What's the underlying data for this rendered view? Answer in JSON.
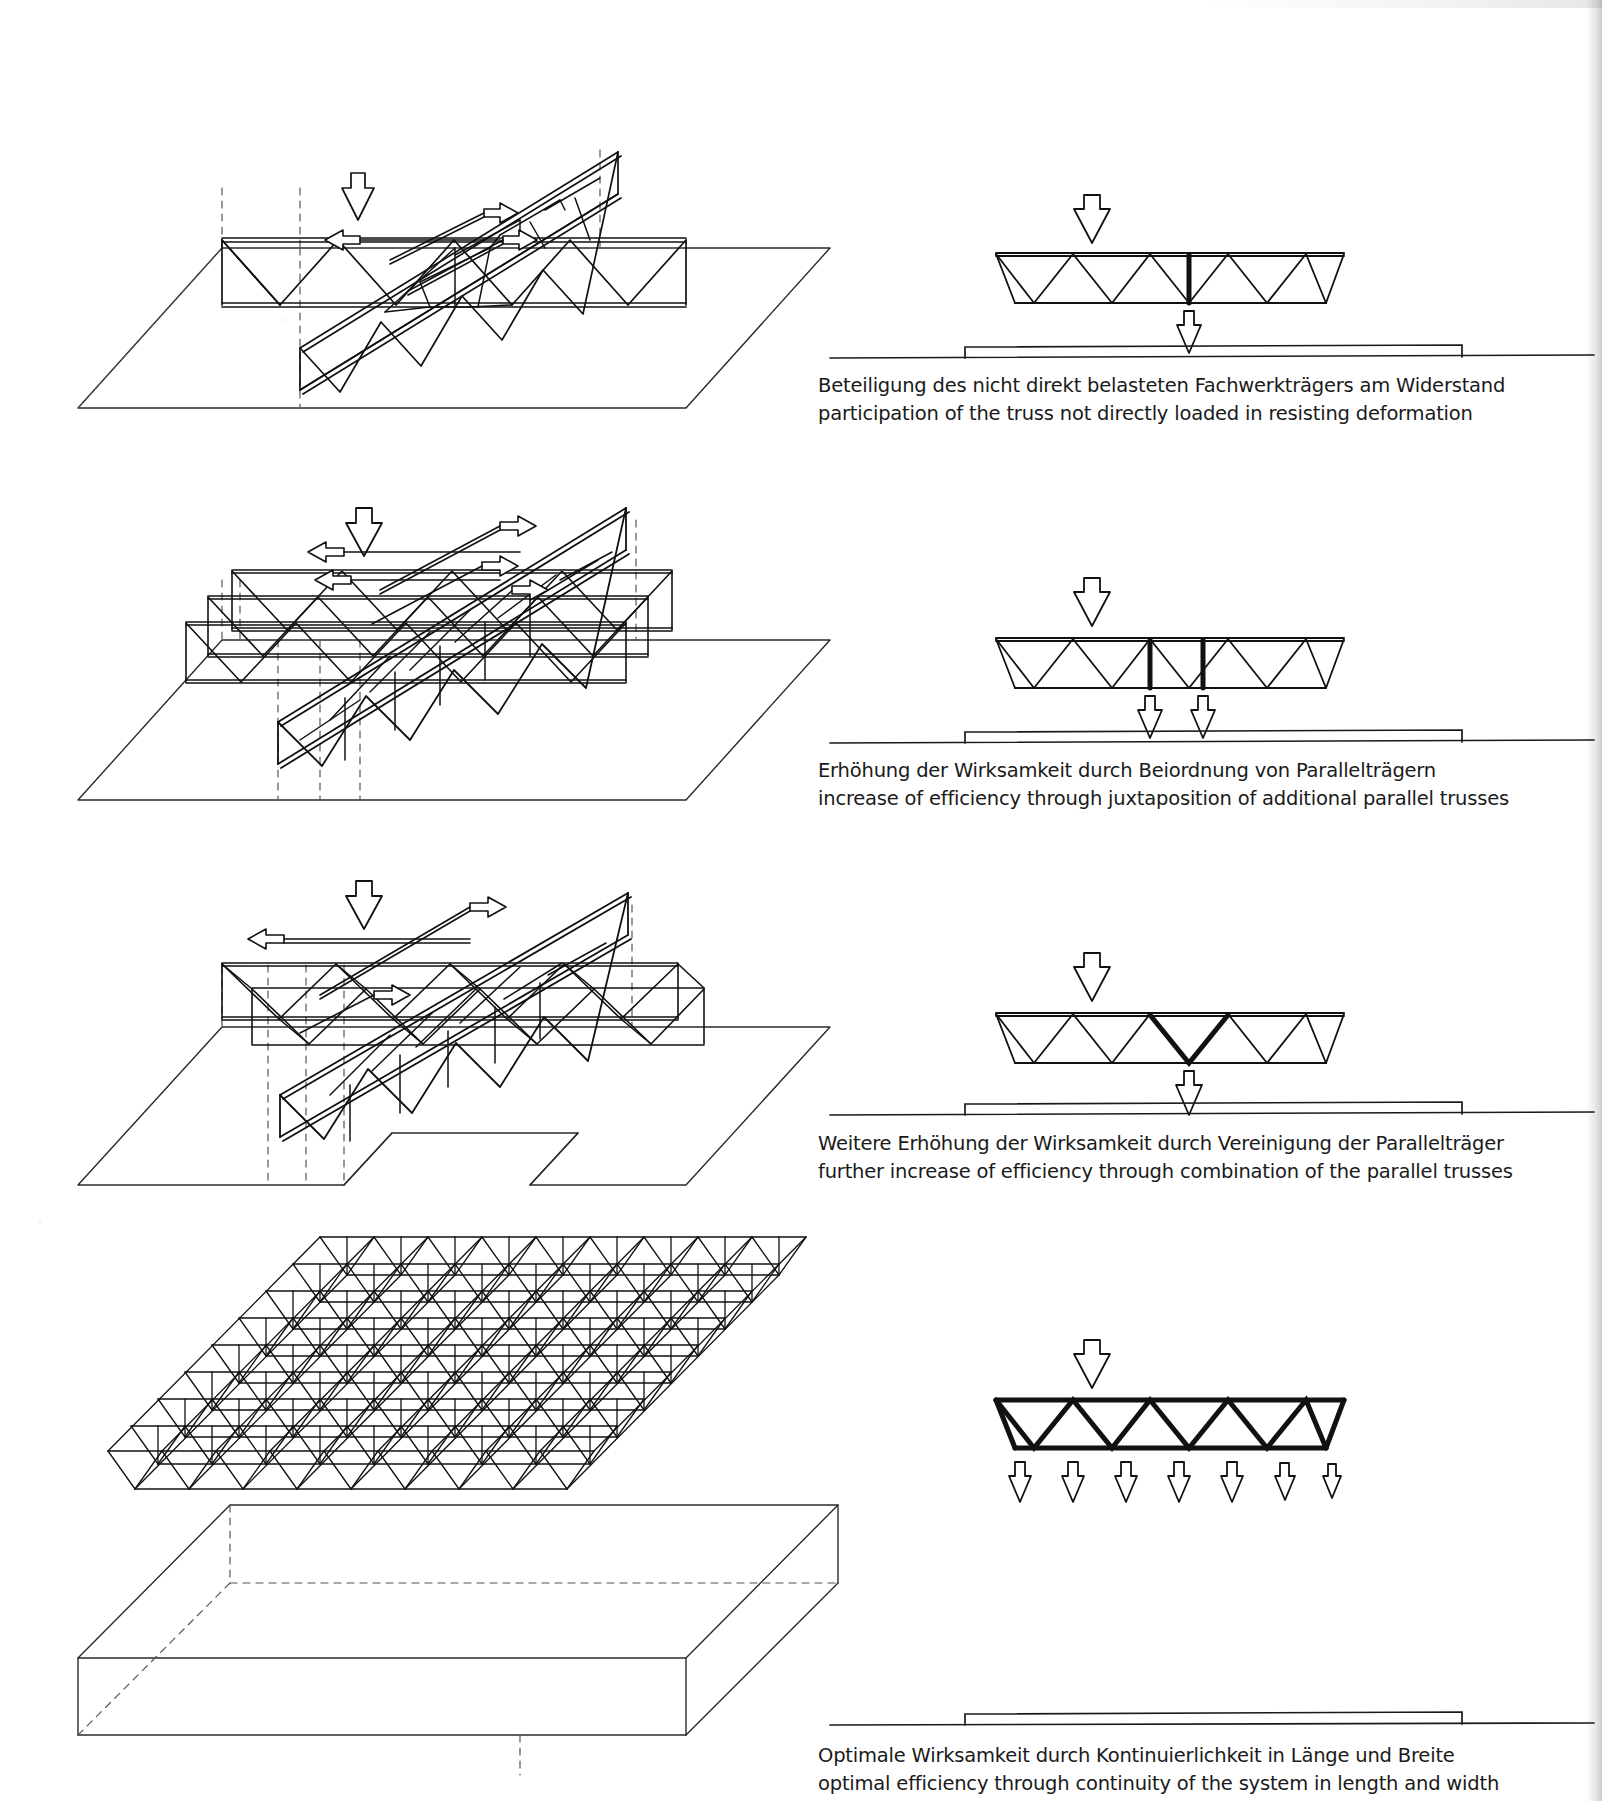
{
  "document": {
    "kind": "structural-engineering-plate",
    "language_pair": "German / English",
    "background": "#ffffff",
    "ink": "#111111"
  },
  "rows": [
    {
      "id": "row-1",
      "caption": {
        "de": "Beteiligung des nicht direkt belasteten Fachwerkträgers am Widerstand",
        "en": "participation of the truss not directly loaded     in resisting  deformation"
      },
      "section": {
        "bays": 9,
        "loaded_bay_index": 4,
        "load_arrows_down": 1,
        "reaction_arrows_up": 1,
        "bold_members": [
          "vertical-at-bay-5"
        ],
        "description": "single truss in elevation, one downward load, one upward reaction"
      },
      "isometric": {
        "trusses": 1,
        "load_arrows_down": 1,
        "lateral_arrows": 3,
        "description": "one loaded truss crossing one orthogonal truss on a plan slab"
      }
    },
    {
      "id": "row-2",
      "caption": {
        "de": "Erhöhung der Wirksamkeit      durch Beiordnung  von  Parallelträgern",
        "en": "increase of efficiency through  juxtaposition of additional parallel trusses"
      },
      "section": {
        "bays": 9,
        "loaded_bay_index": 4,
        "load_arrows_down": 1,
        "reaction_arrows_up": 2,
        "bold_members": [
          "vertical-at-bay-5",
          "vertical-at-bay-6"
        ],
        "description": "elevation with two bold verticals and two upward reactions"
      },
      "isometric": {
        "trusses": 3,
        "load_arrows_down": 1,
        "lateral_arrows": 5,
        "description": "three parallel trusses juxtaposed crossing the loaded truss"
      }
    },
    {
      "id": "row-3",
      "caption": {
        "de": "Weitere Erhöhung der Wirksamkeit durch Vereinigung der Parallelträger",
        "en": "further increase of efficiency through combination of the parallel trusses"
      },
      "section": {
        "bays": 9,
        "loaded_bay_index": 4,
        "load_arrows_down": 1,
        "reaction_arrows_up": 1,
        "bold_members": [
          "diagonal-pair-V-at-mid"
        ],
        "description": "elevation with a bold V of two diagonals at mid span, one reaction"
      },
      "isometric": {
        "trusses": 3,
        "load_arrows_down": 1,
        "lateral_arrows": 3,
        "description": "parallel trusses combined into a connected grid over a notched slab"
      }
    },
    {
      "id": "row-4",
      "caption": {
        "de": "Optimale Wirksamkeit durch Kontinuierlichkeit  in Länge  und Breite",
        "en": "optimal efficiency through continuity of the system in length and width"
      },
      "section": {
        "bays": 9,
        "loaded_bay_index": 4,
        "load_arrows_down": 1,
        "reaction_arrows_up": 7,
        "bold_members": [
          "all-chords",
          "all-diagonals"
        ],
        "description": "fully bold truss in elevation with seven upward reactions"
      },
      "isometric": {
        "trusses": "continuous-space-frame",
        "load_arrows_down": 0,
        "lateral_arrows": 0,
        "description": "double-layer space frame / grid continuous in both directions on a slab"
      }
    }
  ],
  "icons": {
    "arrow_down": "load-arrow-down-icon",
    "arrow_up": "reaction-arrow-up-icon",
    "arrow_left": "deformation-arrow-left-icon",
    "arrow_right": "deformation-arrow-right-icon"
  },
  "colors": {
    "ink": "#111111",
    "light_line": "#3a3a3a",
    "dashed": "#555555",
    "paper": "#ffffff"
  }
}
